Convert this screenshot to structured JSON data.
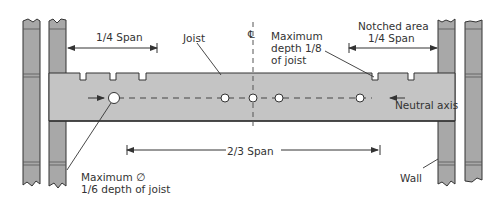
{
  "diagram": {
    "colors": {
      "joist_fill": "#c4c4c4",
      "wall_fill": "#a8a8a8",
      "line": "#333333",
      "background": "#ffffff"
    },
    "labels": {
      "quarter_span_left": "1/4  Span",
      "joist": "Joist",
      "centerline_symbol": "℄",
      "max_depth_line1": "Maximum",
      "max_depth_line2": "depth 1/8",
      "max_depth_line3": "of joist",
      "notched_area_line1": "Notched area",
      "notched_area_line2": "1/4  Span",
      "neutral_axis": "Neutral axis",
      "two_thirds_span": "2/3  Span",
      "max_diameter_line1": "Maximum ∅",
      "max_diameter_line2": "1/6  depth of joist",
      "wall": "Wall"
    }
  }
}
